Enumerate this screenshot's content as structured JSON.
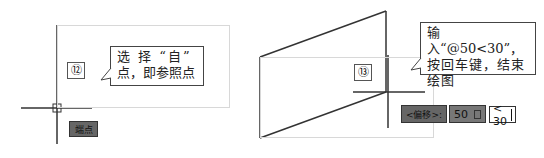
{
  "left_panel": {
    "step_number": "⑫",
    "callout_line1": "选 择 “自”",
    "callout_line2": "点，即参照点",
    "tooltip_label": "端点"
  },
  "right_panel": {
    "step_number": "⑬",
    "callout_line1": "输入“@50<30”，",
    "callout_line2": "按回车键，结束",
    "callout_line3": "绘图",
    "offset_label": "<偏移>:",
    "distance_value": "50",
    "lock_icon": "lock-icon",
    "angle_value": "< 30"
  },
  "colors": {
    "line": "#333333",
    "frame": "#d8d8d8",
    "dark_field": "#777777"
  }
}
